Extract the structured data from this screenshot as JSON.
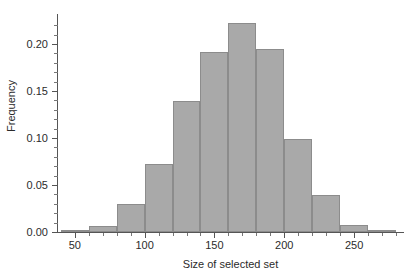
{
  "chart_data": {
    "type": "bar",
    "subtype": "histogram",
    "title": "",
    "xlabel": "Size of selected set",
    "ylabel": "Frequency",
    "xlim": [
      38,
      285
    ],
    "ylim": [
      0.0,
      0.232
    ],
    "grid": false,
    "legend": null,
    "bin_width": 20,
    "bin_edges": [
      40,
      60,
      80,
      100,
      120,
      140,
      160,
      180,
      200,
      220,
      240,
      260,
      280
    ],
    "bin_centers": [
      50,
      70,
      90,
      110,
      130,
      150,
      170,
      190,
      210,
      230,
      250,
      270
    ],
    "values": [
      0.001,
      0.006,
      0.03,
      0.072,
      0.139,
      0.192,
      0.222,
      0.195,
      0.099,
      0.039,
      0.007,
      0.001
    ],
    "x_ticks": [
      50,
      100,
      150,
      200,
      250
    ],
    "x_tick_labels": [
      "50",
      "100",
      "150",
      "200",
      "250"
    ],
    "x_minor_ticks": [
      60,
      70,
      80,
      90,
      110,
      120,
      130,
      140,
      160,
      170,
      180,
      190,
      210,
      220,
      230,
      240,
      260,
      270,
      280
    ],
    "y_ticks": [
      0.0,
      0.05,
      0.1,
      0.15,
      0.2
    ],
    "y_tick_labels": [
      "0.00",
      "0.05",
      "0.10",
      "0.15",
      "0.20"
    ],
    "y_minor_ticks": [
      0.01,
      0.02,
      0.03,
      0.04,
      0.06,
      0.07,
      0.08,
      0.09,
      0.11,
      0.12,
      0.13,
      0.14,
      0.16,
      0.17,
      0.18,
      0.19,
      0.21,
      0.22
    ],
    "colors": {
      "bar_fill": "#a9a9a9",
      "bar_edge": "#8c8c8c",
      "axis": "#555555",
      "text": "#2b2b2b",
      "background": "#ffffff"
    }
  }
}
